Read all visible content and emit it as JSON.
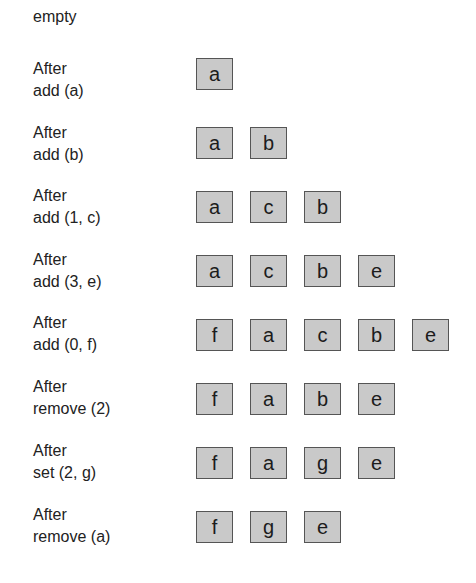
{
  "colors": {
    "box_fill": "#c9c9c9",
    "box_border": "#555555",
    "text": "#222222"
  },
  "rows": [
    {
      "label": "empty",
      "items": []
    },
    {
      "label": "After\nadd (a)",
      "items": [
        "a"
      ]
    },
    {
      "label": "After\nadd (b)",
      "items": [
        "a",
        "b"
      ]
    },
    {
      "label": "After\nadd (1, c)",
      "items": [
        "a",
        "c",
        "b"
      ]
    },
    {
      "label": "After\nadd (3, e)",
      "items": [
        "a",
        "c",
        "b",
        "e"
      ]
    },
    {
      "label": "After\nadd (0, f)",
      "items": [
        "f",
        "a",
        "c",
        "b",
        "e"
      ]
    },
    {
      "label": "After\nremove (2)",
      "items": [
        "f",
        "a",
        "b",
        "e"
      ]
    },
    {
      "label": "After\nset (2, g)",
      "items": [
        "f",
        "a",
        "g",
        "e"
      ]
    },
    {
      "label": "After\nremove (a)",
      "items": [
        "f",
        "g",
        "e"
      ]
    }
  ]
}
